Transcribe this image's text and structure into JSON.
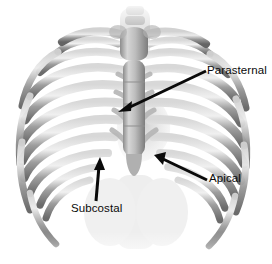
{
  "image": {
    "title": "Anterior rib cage with echocardiographic window annotations",
    "subject": "thoracic-skeleton",
    "background_color": "#ffffff",
    "bone_color_light": "#e8e8e8",
    "bone_color_mid": "#a9a9a9",
    "bone_color_dark": "#6f6f6f",
    "annotation_color": "#0a0a0a",
    "width": 272,
    "height": 264
  },
  "annotations": [
    {
      "id": "parasternal",
      "label": "Parasternal",
      "arrow_from_x": 206,
      "arrow_from_y": 71,
      "arrow_to_x": 121,
      "arrow_to_y": 111
    },
    {
      "id": "apical",
      "label": "Apical",
      "arrow_from_x": 207,
      "arrow_from_y": 180,
      "arrow_to_x": 156,
      "arrow_to_y": 156
    },
    {
      "id": "subcostal",
      "label": "Subcostal",
      "arrow_from_x": 96,
      "arrow_from_y": 201,
      "arrow_to_x": 100,
      "arrow_to_y": 159
    }
  ],
  "anatomy": {
    "sternum_label": "sternum",
    "ribs_left_count": 9,
    "ribs_right_count": 9,
    "clavicle_label": "clavicle",
    "costal_margin_label": "costal-margin"
  }
}
